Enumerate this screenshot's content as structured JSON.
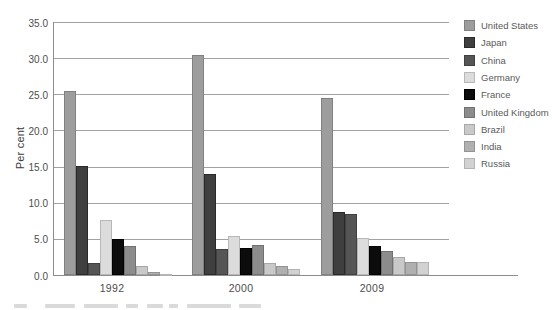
{
  "figure": {
    "ylabel": "Per cent"
  },
  "chart_data": {
    "type": "bar",
    "title": "",
    "xlabel": "",
    "ylabel": "Per cent",
    "ylim": [
      0,
      35
    ],
    "grid": true,
    "legend_position": "right",
    "categories": [
      "1992",
      "2000",
      "2009"
    ],
    "ytick_labels": [
      "0.0",
      "5.0",
      "10.0",
      "15.0",
      "20.0",
      "25.0",
      "30.0",
      "35.0"
    ],
    "series": [
      {
        "name": "United States",
        "values": [
          25.4,
          30.4,
          24.5
        ],
        "color": "#9d9d9d",
        "border": "#818181"
      },
      {
        "name": "Japan",
        "values": [
          15.1,
          14.0,
          8.7
        ],
        "color": "#3f3f3f",
        "border": "#2a2a2a"
      },
      {
        "name": "China",
        "values": [
          1.6,
          3.6,
          8.5
        ],
        "color": "#555555",
        "border": "#404040"
      },
      {
        "name": "Germany",
        "values": [
          7.6,
          5.4,
          5.1
        ],
        "color": "#dcdcdc",
        "border": "#b8b8b8"
      },
      {
        "name": "France",
        "values": [
          5.0,
          3.7,
          4.0
        ],
        "color": "#0c0c0c",
        "border": "#000000"
      },
      {
        "name": "United Kingdom",
        "values": [
          4.0,
          4.2,
          3.3
        ],
        "color": "#8c8c8c",
        "border": "#717171"
      },
      {
        "name": "Brazil",
        "values": [
          1.2,
          1.6,
          2.5
        ],
        "color": "#c9c9c9",
        "border": "#a8a8a8"
      },
      {
        "name": "India",
        "values": [
          0.4,
          1.2,
          1.8
        ],
        "color": "#b0b0b0",
        "border": "#949494"
      },
      {
        "name": "Russia",
        "values": [
          0.2,
          0.8,
          1.8
        ],
        "color": "#d2d2d2",
        "border": "#b4b4b4"
      }
    ]
  }
}
